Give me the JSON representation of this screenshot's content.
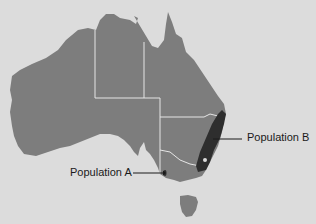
{
  "map": {
    "subject": "Australia",
    "colors": {
      "background": "#dcdcdc",
      "land": "#7d7d7d",
      "borders": "#e6e6e6",
      "population_b_region": "#2e2e2e",
      "population_a_region": "#2e2e2e"
    },
    "labels": {
      "population_a": "Population A",
      "population_b": "Population B"
    }
  }
}
